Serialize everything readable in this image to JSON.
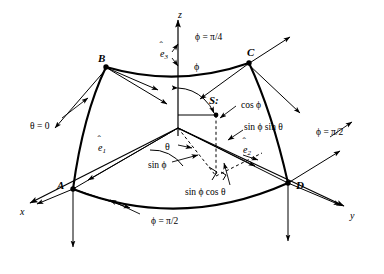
{
  "figure": {
    "stroke_color": "#000000",
    "background_color": "#ffffff"
  },
  "axes": [
    {
      "name": "z-axis",
      "label": "z",
      "x": 178,
      "y": 10
    },
    {
      "name": "x-axis",
      "label": "x",
      "x": 20,
      "y": 207
    },
    {
      "name": "y-axis",
      "label": "y",
      "x": 350,
      "y": 211
    }
  ],
  "vertices": [
    {
      "name": "point-b",
      "label": "B",
      "x": 98,
      "y": 53
    },
    {
      "name": "point-c",
      "label": "C",
      "x": 247,
      "y": 47
    },
    {
      "name": "point-a",
      "label": "A",
      "x": 57,
      "y": 180
    },
    {
      "name": "point-d",
      "label": "D",
      "x": 296,
      "y": 180
    },
    {
      "name": "point-s",
      "label": "S:",
      "x": 209,
      "y": 95
    }
  ],
  "basis_vectors": [
    {
      "name": "e1",
      "label": "e",
      "sub": "1",
      "x": 98,
      "y": 143
    },
    {
      "name": "e2",
      "label": "e",
      "sub": "2",
      "x": 243,
      "y": 145
    },
    {
      "name": "e3",
      "label": "e",
      "sub": "3",
      "x": 160,
      "y": 49
    }
  ],
  "angle_labels": [
    {
      "name": "phi-angle",
      "label": "ϕ",
      "x": 194,
      "y": 62
    },
    {
      "name": "theta-angle",
      "label": "θ",
      "x": 165,
      "y": 142
    }
  ],
  "boundary_labels": [
    {
      "name": "phi-pi-over-4",
      "label": "ϕ = π/4",
      "x": 195,
      "y": 33
    },
    {
      "name": "theta-equals-zero",
      "label": "θ = 0",
      "x": 30,
      "y": 122
    },
    {
      "name": "phi-pi-over-2-right",
      "label": "ϕ = π/2",
      "x": 316,
      "y": 128
    },
    {
      "name": "phi-pi-over-2-bottom",
      "label": "ϕ = π/2",
      "x": 151,
      "y": 217
    }
  ],
  "component_labels": [
    {
      "name": "cos-phi-component",
      "label": "cos ϕ",
      "x": 241,
      "y": 101
    },
    {
      "name": "sin-phi-sin-theta-component",
      "label": "sin ϕ sin θ",
      "x": 244,
      "y": 123
    },
    {
      "name": "sin-phi-cos-theta-component",
      "label": "sin ϕ cos θ",
      "x": 185,
      "y": 188
    },
    {
      "name": "sin-phi-length",
      "label": "sin ϕ",
      "x": 148,
      "y": 161
    }
  ]
}
